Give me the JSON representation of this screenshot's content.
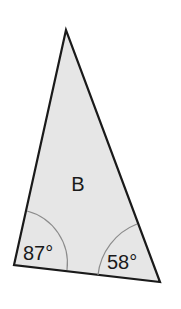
{
  "diagram": {
    "shape": "triangle",
    "label": "B",
    "angles": [
      {
        "vertex": "bottom-left",
        "label": "87°"
      },
      {
        "vertex": "bottom-right",
        "label": "58°"
      }
    ],
    "colors": {
      "fill": "#e6e6e6",
      "stroke": "#1a1a1a",
      "arc": "#8c8c8c"
    }
  }
}
